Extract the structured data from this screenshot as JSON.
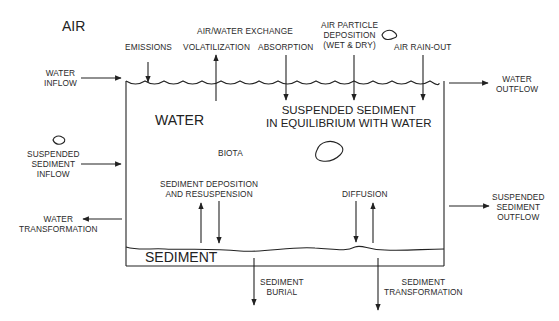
{
  "diagram": {
    "type": "environmental fate compartment model",
    "compartments": {
      "air": "AIR",
      "water": "WATER",
      "sediment": "SEDIMENT",
      "biota": "BIOTA",
      "suspended": "SUSPENDED SEDIMENT",
      "suspended_line2": "IN EQUILIBRIUM WITH WATER"
    },
    "header": {
      "air_water_exchange": "AIR/WATER EXCHANGE"
    },
    "processes": {
      "emissions": "EMISSIONS",
      "volatilization": "VOLATILIZATION",
      "absorption": "ABSORPTION",
      "air_particle_1": "AIR PARTICLE",
      "air_particle_2": "DEPOSITION",
      "air_particle_3": "(WET & DRY)",
      "air_rainout": "AIR RAIN-OUT",
      "water_inflow_1": "WATER",
      "water_inflow_2": "INFLOW",
      "water_outflow_1": "WATER",
      "water_outflow_2": "OUTFLOW",
      "susp_inflow_1": "SUSPENDED",
      "susp_inflow_2": "SEDIMENT",
      "susp_inflow_3": "INFLOW",
      "water_transf_1": "WATER",
      "water_transf_2": "TRANSFORMATION",
      "deposition_1": "SEDIMENT DEPOSITION",
      "deposition_2": "AND RESUSPENSION",
      "diffusion": "DIFFUSION",
      "susp_outflow_1": "SUSPENDED",
      "susp_outflow_2": "SEDIMENT",
      "susp_outflow_3": "OUTFLOW",
      "burial_1": "SEDIMENT",
      "burial_2": "BURIAL",
      "sed_transf_1": "SEDIMENT",
      "sed_transf_2": "TRANSFORMATION"
    },
    "colors": {
      "line": "#222222",
      "background": "#ffffff"
    }
  }
}
